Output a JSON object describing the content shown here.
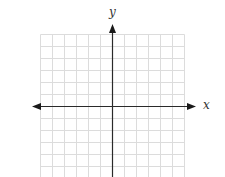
{
  "diagram": {
    "type": "coordinate-plane",
    "x_axis_label": "x",
    "y_axis_label": "y",
    "grid": {
      "left": 40.5,
      "top": 34.5,
      "right": 184.5,
      "bottom": 177,
      "cell_size": 12,
      "columns": 12,
      "rows_visible": 12,
      "line_color": "#dcdcdc"
    },
    "axes": {
      "origin_x": 112.5,
      "origin_y": 106.5,
      "x_axis_start": 32,
      "x_axis_end": 196,
      "y_axis_top": 24,
      "y_axis_bottom": 177,
      "color": "#2a2a2a"
    },
    "arrows": [
      "left",
      "right",
      "up"
    ]
  }
}
